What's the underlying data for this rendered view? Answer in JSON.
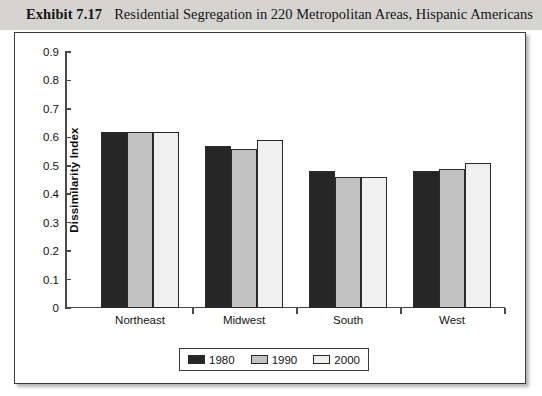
{
  "caption": {
    "label": "Exhibit 7.17",
    "text": "Residential Segregation in 220 Metropolitan Areas, Hispanic Americans"
  },
  "chart_data": {
    "type": "bar",
    "title": "Residential Segregation in 220 Metropolitan Areas, Hispanic Americans",
    "xlabel": "",
    "ylabel": "Dissimilarity Index",
    "ylim": [
      0,
      0.9
    ],
    "ytick_labels": [
      "0.9",
      "0.8",
      "0.7",
      "0.6",
      "0.5",
      "0.4",
      "0.3",
      "0.2",
      "0.1",
      "0"
    ],
    "ytick_values": [
      0.9,
      0.8,
      0.7,
      0.6,
      0.5,
      0.4,
      0.3,
      0.2,
      0.1,
      0
    ],
    "grid": false,
    "legend_position": "bottom",
    "categories": [
      "Northeast",
      "Midwest",
      "South",
      "West"
    ],
    "series": [
      {
        "name": "1980",
        "color": "#262626",
        "values": [
          0.62,
          0.57,
          0.48,
          0.48
        ]
      },
      {
        "name": "1990",
        "color": "#c2c2c2",
        "values": [
          0.62,
          0.56,
          0.46,
          0.49
        ]
      },
      {
        "name": "2000",
        "color": "#f0f0f0",
        "values": [
          0.62,
          0.59,
          0.46,
          0.51
        ]
      }
    ]
  }
}
